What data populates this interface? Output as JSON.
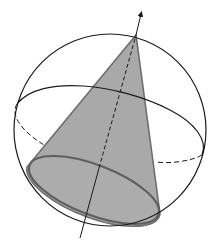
{
  "figure": {
    "colors": {
      "background": "#ffffff",
      "stroke": "#1a1a1a",
      "cone_fill": "#a9a9a9",
      "cone_edge": "#6e6e6e"
    },
    "sphere": {
      "cx": 110,
      "cy": 130,
      "r": 97
    },
    "equator": {
      "front_path": "M 17 104 C 40 75, 120 85, 170 110 C 195 123, 208 140, 202 155",
      "back_path": "M 17 104 C 10 118, 30 140, 55 150",
      "back_path_right": "M 202 155 C 195 160, 170 163, 153 162"
    },
    "cone": {
      "apex": [
        136,
        35
      ],
      "base_ellipse": {
        "cx": 94,
        "cy": 190,
        "rx": 68,
        "ry": 26,
        "rotate": 21
      },
      "left_tangent": [
        27,
        167
      ],
      "right_tangent": [
        160,
        214
      ]
    },
    "axis": {
      "start": [
        80,
        238
      ],
      "end": [
        141,
        13
      ],
      "hidden_from": [
        98,
        170
      ],
      "hidden_to": [
        136,
        35
      ]
    }
  }
}
